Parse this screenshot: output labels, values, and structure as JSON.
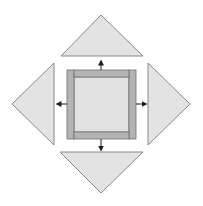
{
  "diagram": {
    "type": "quilt-block-assembly",
    "colors": {
      "background": "#ffffff",
      "triangle_fill": "#e3e3e3",
      "triangle_stroke": "#8a8a8a",
      "strip_fill": "#b4b4b4",
      "center_fill": "#e2e2e2",
      "outline": "#6e6e6e",
      "arrow": "#1e1e1e"
    },
    "center_block": {
      "outer": {
        "x": 67,
        "y": 70,
        "w": 69,
        "h": 69
      },
      "center_square": {
        "x": 74,
        "y": 77,
        "w": 55,
        "h": 55
      },
      "strips": [
        {
          "name": "left-strip",
          "x": 67,
          "y": 70,
          "w": 7,
          "h": 69
        },
        {
          "name": "right-strip",
          "x": 129,
          "y": 70,
          "w": 7,
          "h": 69
        },
        {
          "name": "top-strip",
          "x": 74,
          "y": 70,
          "w": 55,
          "h": 7
        },
        {
          "name": "bottom-strip",
          "x": 74,
          "y": 132,
          "w": 55,
          "h": 7
        }
      ]
    },
    "triangles": [
      {
        "name": "top-triangle",
        "points": "101,15 143,56 61,56"
      },
      {
        "name": "bottom-triangle",
        "points": "60,152 143,152 101,193"
      },
      {
        "name": "left-triangle",
        "points": "12,104 54,63 54,145"
      },
      {
        "name": "right-triangle",
        "points": "148,63 190,104 148,145"
      }
    ],
    "arrows": [
      {
        "name": "arrow-up",
        "x1": 101,
        "y1": 70,
        "x2": 101,
        "y2": 61
      },
      {
        "name": "arrow-down",
        "x1": 101,
        "y1": 139,
        "x2": 101,
        "y2": 150
      },
      {
        "name": "arrow-left",
        "x1": 67,
        "y1": 104,
        "x2": 57,
        "y2": 104
      },
      {
        "name": "arrow-right",
        "x1": 136,
        "y1": 104,
        "x2": 146,
        "y2": 104
      }
    ]
  }
}
